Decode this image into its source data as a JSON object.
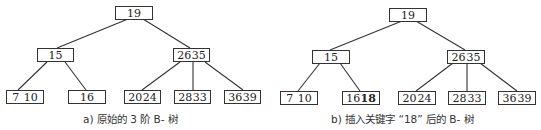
{
  "trees": [
    {
      "id": "a",
      "caption": "a) 原始的 3 阶 B- 树",
      "nodes": {
        "root": {
          "keys": [
            "19"
          ]
        },
        "left": {
          "keys": [
            "15"
          ]
        },
        "right": {
          "keys": [
            "26",
            "35"
          ]
        },
        "leaf1": {
          "keys": [
            "7",
            "10"
          ]
        },
        "leaf2": {
          "keys": [
            "16"
          ]
        },
        "leaf3": {
          "keys": [
            "20",
            "24"
          ]
        },
        "leaf4": {
          "keys": [
            "28",
            "33"
          ]
        },
        "leaf5": {
          "keys": [
            "36",
            "39"
          ]
        }
      }
    },
    {
      "id": "b",
      "caption": "b) 插入关键字 “18” 后的 B- 树",
      "highlighted_key": "18",
      "nodes": {
        "root": {
          "keys": [
            "19"
          ]
        },
        "left": {
          "keys": [
            "15"
          ]
        },
        "right": {
          "keys": [
            "26",
            "35"
          ]
        },
        "leaf1": {
          "keys": [
            "7",
            "10"
          ]
        },
        "leaf2": {
          "keys": [
            "16",
            "18"
          ]
        },
        "leaf3": {
          "keys": [
            "20",
            "24"
          ]
        },
        "leaf4": {
          "keys": [
            "28",
            "33"
          ]
        },
        "leaf5": {
          "keys": [
            "36",
            "39"
          ]
        }
      }
    }
  ]
}
